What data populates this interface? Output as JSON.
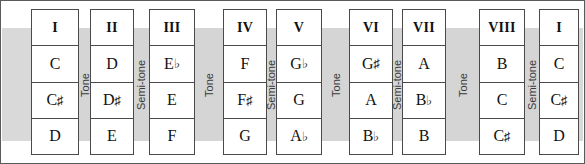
{
  "diagram": {
    "row_labels": [
      "degree",
      "note_upper",
      "note_middle",
      "note_lower"
    ],
    "columns": [
      {
        "degree": "I",
        "notes": [
          "C",
          "C♯",
          "D"
        ]
      },
      {
        "degree": "II",
        "notes": [
          "D",
          "D♯",
          "E"
        ]
      },
      {
        "degree": "III",
        "notes": [
          "E♭",
          "E",
          "F"
        ]
      },
      {
        "degree": "IV",
        "notes": [
          "F",
          "F♯",
          "G"
        ]
      },
      {
        "degree": "V",
        "notes": [
          "G♭",
          "G",
          "A♭"
        ]
      },
      {
        "degree": "VI",
        "notes": [
          "G♯",
          "A",
          "B♭"
        ]
      },
      {
        "degree": "VII",
        "notes": [
          "A",
          "B♭",
          "B"
        ]
      },
      {
        "degree": "VIII",
        "notes": [
          "B",
          "C",
          "C♯"
        ]
      },
      {
        "degree": "I",
        "notes": [
          "C",
          "C♯",
          "D"
        ]
      }
    ],
    "gaps": [
      {
        "label": "Tone"
      },
      {
        "label": "Semi-tone"
      },
      {
        "label": "Tone"
      },
      {
        "label": "Semi-tone"
      },
      {
        "label": "Tone"
      },
      {
        "label": "Semi-tone"
      },
      {
        "label": "Tone"
      },
      {
        "label": "Semi-tone"
      }
    ],
    "colors": {
      "background": "#ffffff",
      "band": "#d9d9d9",
      "gap": "#d5d5d5",
      "border": "#4a4a4a",
      "text": "#111111"
    }
  }
}
